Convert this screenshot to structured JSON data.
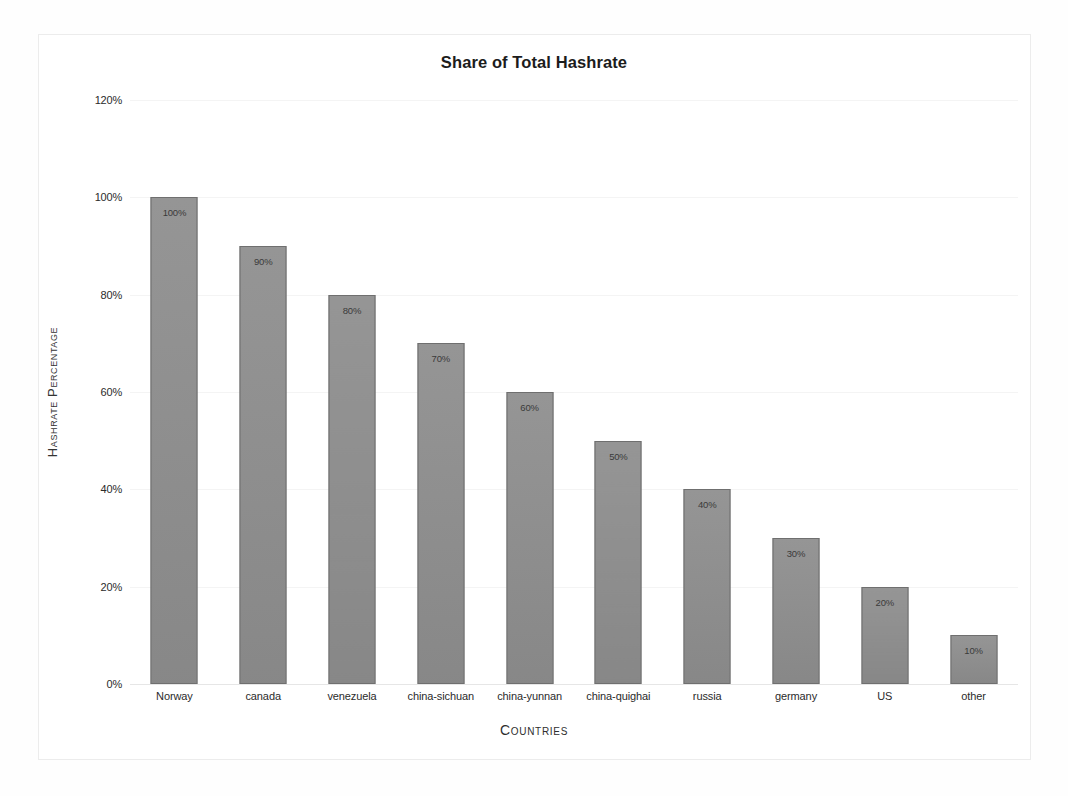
{
  "chart_data": {
    "type": "bar",
    "title": "Share of Total Hashrate",
    "xlabel": "Countries",
    "ylabel": "Hashrate Percentage",
    "categories": [
      "Norway",
      "canada",
      "venezuela",
      "china-sichuan",
      "china-yunnan",
      "china-quighai",
      "russia",
      "germany",
      "US",
      "other"
    ],
    "values": [
      100,
      90,
      80,
      70,
      60,
      50,
      40,
      30,
      20,
      10
    ],
    "value_labels": [
      "100%",
      "90%",
      "80%",
      "70%",
      "60%",
      "50%",
      "40%",
      "30%",
      "20%",
      "10%"
    ],
    "ylim": [
      0,
      120
    ],
    "ytick_values": [
      0,
      20,
      40,
      60,
      80,
      100,
      120
    ],
    "ytick_labels": [
      "0%",
      "20%",
      "40%",
      "60%",
      "80%",
      "100%",
      "120%"
    ],
    "grid": true,
    "legend": false,
    "bar_color": "#8d8d8d",
    "bar_border_color": "#6f6f6f",
    "text_color": "#2b2b2b",
    "background_color": "#ffffff",
    "gridline_color": "#f4f4f4"
  }
}
